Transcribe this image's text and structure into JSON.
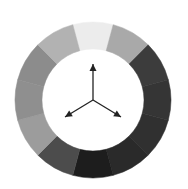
{
  "diagram": {
    "type": "color-wheel",
    "center": [
      93,
      100
    ],
    "outer_radius": 78,
    "inner_radius": 51,
    "segments": [
      {
        "angle": 0,
        "color": "#ececec"
      },
      {
        "angle": 30,
        "color": "#a9a9a9"
      },
      {
        "angle": 60,
        "color": "#3c3c3c"
      },
      {
        "angle": 90,
        "color": "#353535"
      },
      {
        "angle": 120,
        "color": "#303030"
      },
      {
        "angle": 150,
        "color": "#2a2a2a"
      },
      {
        "angle": 180,
        "color": "#1d1d1d"
      },
      {
        "angle": 210,
        "color": "#4c4c4c"
      },
      {
        "angle": 240,
        "color": "#9c9c9c"
      },
      {
        "angle": 270,
        "color": "#8f8f8f"
      },
      {
        "angle": 300,
        "color": "#8c8c8c"
      },
      {
        "angle": 330,
        "color": "#b2b2b2"
      }
    ],
    "arrows": [
      {
        "direction": "up",
        "tip": [
          93,
          64
        ]
      },
      {
        "direction": "down-left",
        "tip": [
          65,
          117
        ]
      },
      {
        "direction": "down-right",
        "tip": [
          121,
          117
        ]
      }
    ],
    "arrow_color": "#222222"
  }
}
